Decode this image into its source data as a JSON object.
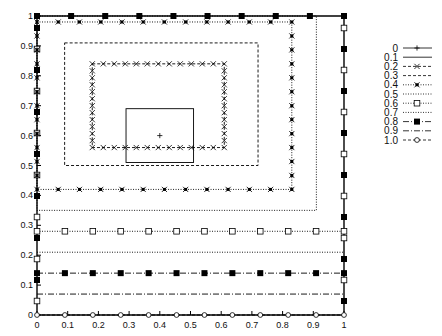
{
  "chart_data": {
    "type": "line",
    "title": "",
    "xlabel": "",
    "ylabel": "",
    "xlim": [
      0,
      1
    ],
    "ylim": [
      0,
      1
    ],
    "grid": false,
    "legend_position": "right",
    "x_ticks": [
      "0",
      "0.1",
      "0.2",
      "0.3",
      "0.4",
      "0.5",
      "0.6",
      "0.7",
      "0.8",
      "0.9",
      "1"
    ],
    "y_ticks": [
      "0",
      "0.1",
      "0.2",
      "0.3",
      "0.4",
      "0.5",
      "0.6",
      "0.7",
      "0.8",
      "0.9",
      "1"
    ],
    "legend": [
      "0",
      "0.1",
      "0.2",
      "0.3",
      "0.4",
      "0.5",
      "0.6",
      "0.7",
      "0.8",
      "0.9",
      "1.0"
    ],
    "series": [
      {
        "name": "0",
        "style": "solid",
        "marker": "plus",
        "shape": "point",
        "x": [
          0.4
        ],
        "y": [
          0.6
        ]
      },
      {
        "name": "0.1",
        "style": "solid",
        "marker": "none",
        "shape": "rectangle",
        "x": [
          0.29,
          0.51
        ],
        "y": [
          0.51,
          0.69
        ]
      },
      {
        "name": "0.2",
        "style": "dashed",
        "marker": "x",
        "shape": "rectangle",
        "x": [
          0.18,
          0.61
        ],
        "y": [
          0.56,
          0.84
        ]
      },
      {
        "name": "0.3",
        "style": "dashed",
        "marker": "none",
        "shape": "rectangle",
        "x": [
          0.09,
          0.72
        ],
        "y": [
          0.5,
          0.91
        ]
      },
      {
        "name": "0.4",
        "style": "dotted",
        "marker": "star",
        "shape": "rectangle",
        "x": [
          0.0,
          0.83
        ],
        "y": [
          0.42,
          0.98
        ]
      },
      {
        "name": "0.5",
        "style": "dotted",
        "marker": "none",
        "shape": "rectangle",
        "x": [
          0.0,
          0.91
        ],
        "y": [
          0.35,
          1.0
        ]
      },
      {
        "name": "0.6",
        "style": "dotted",
        "marker": "square-open",
        "shape": "hline",
        "x": [
          0,
          1
        ],
        "y": [
          0.28,
          0.28
        ]
      },
      {
        "name": "0.7",
        "style": "dotted",
        "marker": "none",
        "shape": "hline",
        "x": [
          0,
          1
        ],
        "y": [
          0.21,
          0.21
        ]
      },
      {
        "name": "0.8",
        "style": "dashdot",
        "marker": "square-filled",
        "shape": "hline",
        "x": [
          0,
          1
        ],
        "y": [
          0.14,
          0.14
        ]
      },
      {
        "name": "0.9",
        "style": "dashdot",
        "marker": "none",
        "shape": "hline",
        "x": [
          0,
          1
        ],
        "y": [
          0.07,
          0.07
        ]
      },
      {
        "name": "1.0",
        "style": "dashed",
        "marker": "circle-open",
        "shape": "hline",
        "x": [
          0,
          1
        ],
        "y": [
          0.0,
          0.0
        ]
      }
    ]
  }
}
